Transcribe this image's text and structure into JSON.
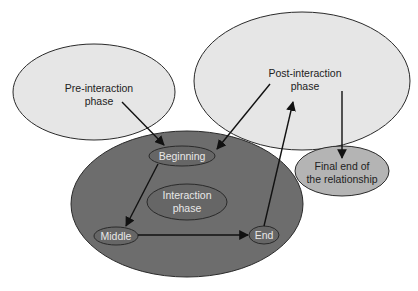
{
  "diagram": {
    "colors": {
      "outer_light": "#e6e6e6",
      "interaction_fill": "#6d6d6d",
      "inner_fill": "#666666",
      "final_fill": "#b4b4b4",
      "stroke": "#2a2a2a"
    },
    "nodes": {
      "pre": {
        "line1": "Pre-interaction",
        "line2": "phase"
      },
      "post": {
        "line1": "Post-interaction",
        "line2": "phase"
      },
      "final": {
        "line1": "Final end of",
        "line2": "the relationship"
      },
      "interaction": {
        "line1": "Interaction",
        "line2": "phase"
      },
      "beginning": {
        "label": "Beginning"
      },
      "middle": {
        "label": "Middle"
      },
      "end": {
        "label": "End"
      }
    },
    "edges": [
      {
        "from": "Pre-interaction phase",
        "to": "Beginning"
      },
      {
        "from": "Post-interaction phase",
        "to": "Beginning"
      },
      {
        "from": "Beginning",
        "to": "Middle"
      },
      {
        "from": "Middle",
        "to": "End"
      },
      {
        "from": "End",
        "to": "Post-interaction phase"
      },
      {
        "from": "Post-interaction phase",
        "to": "Final end of the relationship"
      }
    ]
  }
}
